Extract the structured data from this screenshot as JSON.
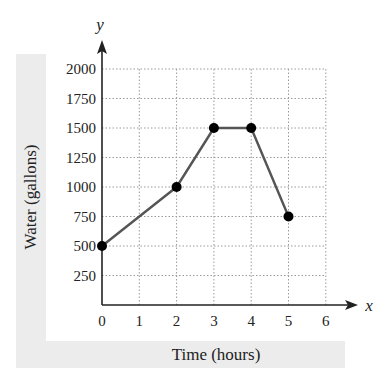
{
  "chart_data": {
    "type": "line",
    "title": "",
    "xlabel": "Time (hours)",
    "ylabel": "Water (gallons)",
    "x_axis_var": "x",
    "y_axis_var": "y",
    "x": [
      0,
      2,
      3,
      4,
      5
    ],
    "series": [
      {
        "name": "Water",
        "values": [
          500,
          1000,
          1500,
          1500,
          750
        ]
      }
    ],
    "xlim": [
      0,
      6
    ],
    "ylim": [
      0,
      2000
    ],
    "x_ticks": [
      "0",
      "1",
      "2",
      "3",
      "4",
      "5",
      "6"
    ],
    "y_ticks": [
      "250",
      "500",
      "750",
      "1000",
      "1250",
      "1500",
      "1750",
      "2000"
    ],
    "grid": true,
    "markers": true,
    "legend": null
  },
  "colors": {
    "line": "#555555",
    "marker": "#000000",
    "axis": "#222222",
    "grid": "#9a9a9a",
    "label_band": "#ececec"
  }
}
